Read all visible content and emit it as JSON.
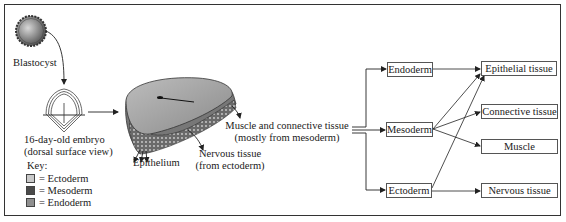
{
  "figure": {
    "left_panel": {
      "blastocyst_label": "Blastocyst",
      "embryo_label_line1": "16-day-old embryo",
      "embryo_label_line2": "(dorsal surface view)",
      "key": {
        "title": "Key:",
        "items": [
          {
            "label": "= Ectoderm",
            "color": "#c9c9c9"
          },
          {
            "label": "= Mesoderm",
            "color": "#4a4a4a"
          },
          {
            "label": "= Endoderm",
            "color": "#8f8f8f"
          }
        ]
      }
    },
    "middle_panel": {
      "epithelium_label": "Epithelium",
      "nervous_label_line1": "Nervous tissue",
      "nervous_label_line2": "(from ectoderm)",
      "muscle_label_line1": "Muscle and connective tissue",
      "muscle_label_line2": "(mostly from mesoderm)"
    },
    "flowchart": {
      "germ_layers": [
        {
          "id": "endoderm",
          "label": "Endoderm"
        },
        {
          "id": "mesoderm",
          "label": "Mesoderm"
        },
        {
          "id": "ectoderm",
          "label": "Ectoderm"
        }
      ],
      "tissues": [
        {
          "id": "epithelial",
          "label": "Epithelial tissue"
        },
        {
          "id": "connective",
          "label": "Connective tissue"
        },
        {
          "id": "muscle",
          "label": "Muscle"
        },
        {
          "id": "nervous",
          "label": "Nervous tissue"
        }
      ],
      "edges": [
        [
          "endoderm",
          "epithelial"
        ],
        [
          "mesoderm",
          "epithelial"
        ],
        [
          "mesoderm",
          "connective"
        ],
        [
          "mesoderm",
          "muscle"
        ],
        [
          "ectoderm",
          "epithelial"
        ],
        [
          "ectoderm",
          "nervous"
        ]
      ]
    }
  }
}
